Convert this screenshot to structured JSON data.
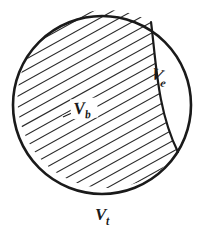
{
  "figure": {
    "title": "Cross-section of a sphere partitioned into a hatched body region and an unhatched lune",
    "background_color": "#ffffff",
    "stroke_color": "#1a1a1a",
    "hatch_color": "#2b2b2b",
    "outline": {
      "shape": "circle",
      "center_x": 102,
      "center_y": 105,
      "radius": 89,
      "stroke_width": 2.6
    },
    "divider": {
      "shape": "arc",
      "start_x": 151,
      "start_y": 22,
      "end_x": 178,
      "end_y": 152,
      "stroke_width": 2.2
    },
    "hatching": {
      "angle_degrees": 29,
      "spacing_px": 9.5,
      "stroke_width": 1.1
    },
    "labels": [
      {
        "name": "label-vb",
        "variable": "V",
        "subscript": "b",
        "x": 76,
        "y": 115,
        "rotation": -4,
        "description": "body volume, inside hatched region"
      },
      {
        "name": "label-ve",
        "variable": "V",
        "subscript": "e",
        "x": 152,
        "y": 80,
        "rotation": 14,
        "description": "excess volume, inside unhatched lune"
      },
      {
        "name": "label-vt",
        "variable": "V",
        "subscript": "t",
        "x": 96,
        "y": 221,
        "rotation": 0,
        "description": "total volume, below the circle"
      }
    ],
    "leader_line": {
      "name": "vb-leader-line",
      "x1": 63,
      "y1": 117,
      "x2": 74,
      "y2": 112
    }
  }
}
